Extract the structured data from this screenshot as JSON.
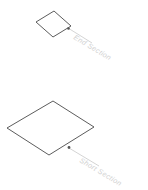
{
  "diagram": {
    "background_color": "#ffffff",
    "line_color": "#4a4a4a",
    "leader_color": "#c9c9c9",
    "label_color": "#d2d2d2",
    "shapes": [
      {
        "id": "end-section",
        "label": "End Section",
        "kind": "isometric-diamond",
        "points": "36,22 54,11 71,26 53,37",
        "leader_path": "M 68,28 L 92,43",
        "leader_dot": {
          "cx": 68.5,
          "cy": 28.5,
          "r": 1.3
        },
        "label_x": 74,
        "label_y": 37,
        "label_rotation": 31
      },
      {
        "id": "short-section",
        "label": "Short Section",
        "kind": "isometric-diamond",
        "points": "7,128 53,101 94,127 49,155",
        "leader_path": "M 69,148 L 99,166",
        "leader_dot": {
          "cx": 69,
          "cy": 147.5,
          "r": 1.4
        },
        "label_x": 80,
        "label_y": 160,
        "label_rotation": 31
      }
    ]
  }
}
